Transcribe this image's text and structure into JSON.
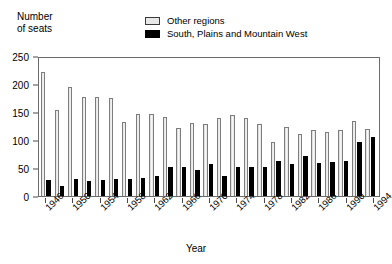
{
  "chart_data": {
    "type": "bar",
    "title": "",
    "subtitle": "",
    "ylabel": "Number\nof seats",
    "xlabel": "Year",
    "ylim": [
      0,
      250
    ],
    "yticks": [
      0,
      50,
      100,
      150,
      200,
      250
    ],
    "ytick_labels": [
      "0",
      "50",
      "100",
      "150",
      "200",
      "250"
    ],
    "grid": false,
    "legend_position": "top-center",
    "categories": [
      "1946",
      "1948",
      "1950",
      "1952",
      "1954",
      "1956",
      "1958",
      "1960",
      "1962",
      "1964",
      "1966",
      "1968",
      "1970",
      "1972",
      "1974",
      "1976",
      "1978",
      "1980",
      "1982",
      "1984",
      "1986",
      "1988",
      "1990",
      "1992",
      "1994"
    ],
    "xtick_labels": [
      "1946",
      "1950",
      "1954",
      "1958",
      "1962",
      "1966",
      "1970",
      "1974",
      "1978",
      "1982",
      "1986",
      "1990",
      "1994"
    ],
    "series": [
      {
        "name": "Other regions",
        "color": "#efefef",
        "values": [
          222,
          153,
          195,
          177,
          176,
          175,
          133,
          147,
          146,
          141,
          122,
          130,
          129,
          140,
          145,
          139,
          128,
          97,
          124,
          110,
          117,
          115,
          117,
          134,
          120
        ]
      },
      {
        "name": "South, Plains and Mountain West",
        "color": "#000000",
        "values": [
          28,
          18,
          30,
          26,
          29,
          31,
          30,
          33,
          35,
          52,
          52,
          46,
          57,
          35,
          51,
          52,
          51,
          62,
          57,
          71,
          59,
          60,
          62,
          96,
          105
        ]
      }
    ]
  },
  "legend": {
    "items": [
      {
        "label": "Other regions",
        "swatch": "other-regions-swatch"
      },
      {
        "label": "South, Plains and Mountain West",
        "swatch": "south-plains-mountain-west-swatch"
      }
    ]
  }
}
